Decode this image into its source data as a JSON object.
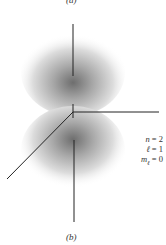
{
  "figure": {
    "top_label": "(a)",
    "bottom_label": "(b)",
    "quantum_numbers": [
      {
        "symbol": "n",
        "value": "2",
        "text": "n = 2"
      },
      {
        "symbol": "ℓ",
        "value": "1",
        "text": "ℓ = 1"
      },
      {
        "symbol": "mℓ",
        "value": "0",
        "text": "mℓ = 0"
      }
    ],
    "orbital": "2p_z electron probability density (two lobes along vertical axis)",
    "colors": {
      "lobe_center": "#7a7a7a",
      "axis": "#222222",
      "background": "#ffffff"
    }
  }
}
